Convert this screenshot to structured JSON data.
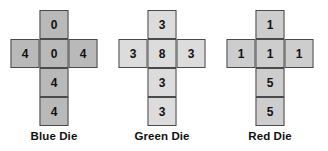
{
  "figure": {
    "type": "dice-nets-diagram",
    "background": "#ffffff",
    "border_color": "#4a4a4a",
    "text_color": "#111111"
  },
  "dice": [
    {
      "label": "Blue Die",
      "fill": "#b9b9b9",
      "faces": {
        "top": "0",
        "left": "4",
        "center": "0",
        "right": "4",
        "bottom": "4",
        "bottom2": "4"
      }
    },
    {
      "label": "Green Die",
      "fill": "#dcdcdc",
      "faces": {
        "top": "3",
        "left": "3",
        "center": "8",
        "right": "3",
        "bottom": "3",
        "bottom2": "3"
      }
    },
    {
      "label": "Red Die",
      "fill": "#cdcdcd",
      "faces": {
        "top": "1",
        "left": "1",
        "center": "1",
        "right": "1",
        "bottom": "5",
        "bottom2": "5"
      }
    }
  ]
}
